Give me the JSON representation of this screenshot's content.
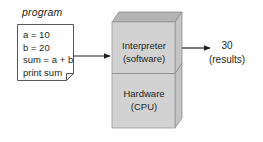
{
  "diagram": {
    "program_card": {
      "caption": "program",
      "code_lines": [
        "a = 10",
        "b = 20",
        "sum = a + b",
        "print sum"
      ]
    },
    "machine_box": {
      "upper_layer": {
        "line1": "Interpreter",
        "line2": "(software)"
      },
      "lower_layer": {
        "line1": "Hardware",
        "line2": "(CPU)"
      }
    },
    "output": {
      "value": "30",
      "caption": "(results)"
    },
    "arrows": [
      {
        "name": "program-to-interpreter",
        "direction": "right"
      },
      {
        "name": "interpreter-to-results",
        "direction": "right"
      }
    ],
    "colors": {
      "stroke": "#231f20",
      "text": "#231f20",
      "box_front": "#d2d2d2",
      "box_top": "#b4b4b4",
      "box_side": "#c4c4c4",
      "card_fill": "#ffffff",
      "background": "#ffffff"
    }
  }
}
